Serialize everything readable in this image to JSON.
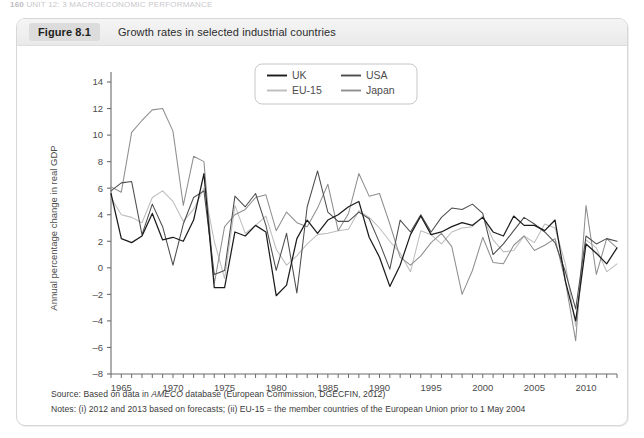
{
  "running_head": {
    "page_number": "160",
    "text": "UNIT 12: 3  MACROECONOMIC PERFORMANCE"
  },
  "figure": {
    "label": "Figure 8.1",
    "title": "Growth rates in selected industrial countries"
  },
  "footer": {
    "source_prefix": "Source: Based on data in ",
    "source_italic": "AMECO",
    "source_suffix": " database (European Commission, DGECFIN, 2012)",
    "notes": "Notes: (i) 2012 and 2013 based on forecasts; (ii) EU-15 = the member countries of the European Union prior to 1 May 2004"
  },
  "colors": {
    "uk": "#1b1b1b",
    "usa": "#4d4d4d",
    "eu15": "#bdbdbd",
    "japan": "#8f8f8f",
    "axis": "#6b6b6b",
    "panel_border": "#d7d7d9",
    "caption_bg": "#efeff0",
    "fig_label_bg": "#dcdcdc"
  },
  "legend": {
    "position": "top-center",
    "entries": [
      {
        "name": "UK",
        "color": "#1b1b1b"
      },
      {
        "name": "USA",
        "color": "#4d4d4d"
      },
      {
        "name": "EU-15",
        "color": "#bdbdbd"
      },
      {
        "name": "Japan",
        "color": "#8f8f8f"
      }
    ]
  },
  "chart_data": {
    "type": "line",
    "title": "Growth rates in selected industrial countries",
    "xlabel": "",
    "ylabel": "Annual percentage change in real GDP",
    "xlim": [
      1964,
      2013
    ],
    "ylim": [
      -8,
      14
    ],
    "ytick_step": 2,
    "yticks": [
      -8,
      -6,
      -4,
      -2,
      0,
      2,
      4,
      6,
      8,
      10,
      12,
      14
    ],
    "xticks_labeled": [
      1965,
      1970,
      1975,
      1980,
      1985,
      1990,
      1995,
      2000,
      2005,
      2010
    ],
    "xtick_step": 1,
    "grid": false,
    "x": [
      1964,
      1965,
      1966,
      1967,
      1968,
      1969,
      1970,
      1971,
      1972,
      1973,
      1974,
      1975,
      1976,
      1977,
      1978,
      1979,
      1980,
      1981,
      1982,
      1983,
      1984,
      1985,
      1986,
      1987,
      1988,
      1989,
      1990,
      1991,
      1992,
      1993,
      1994,
      1995,
      1996,
      1997,
      1998,
      1999,
      2000,
      2001,
      2002,
      2003,
      2004,
      2005,
      2006,
      2007,
      2008,
      2009,
      2010,
      2011,
      2012,
      2013
    ],
    "series": [
      {
        "name": "UK",
        "color": "#1b1b1b",
        "values": [
          5.6,
          2.2,
          1.9,
          2.4,
          4.1,
          2.1,
          2.3,
          2.0,
          3.6,
          7.1,
          -1.5,
          -1.5,
          2.7,
          2.4,
          3.2,
          2.7,
          -2.1,
          -1.3,
          2.2,
          3.6,
          2.6,
          3.6,
          4.0,
          4.6,
          5.0,
          2.3,
          0.8,
          -1.4,
          0.2,
          2.5,
          3.9,
          2.5,
          2.7,
          3.1,
          3.4,
          3.2,
          3.8,
          2.7,
          2.4,
          3.9,
          3.2,
          3.2,
          2.8,
          3.6,
          -1.0,
          -4.0,
          1.8,
          1.1,
          0.3,
          1.5
        ]
      },
      {
        "name": "USA",
        "color": "#4d4d4d",
        "values": [
          5.8,
          6.4,
          6.5,
          2.5,
          4.8,
          3.1,
          0.2,
          3.3,
          5.3,
          5.8,
          -0.5,
          -0.2,
          5.4,
          4.6,
          5.6,
          3.2,
          -0.2,
          2.6,
          -1.9,
          4.6,
          7.3,
          4.2,
          3.5,
          3.5,
          4.2,
          3.7,
          1.9,
          -0.1,
          3.6,
          2.7,
          4.0,
          2.7,
          3.8,
          4.5,
          4.4,
          4.8,
          4.1,
          1.0,
          1.8,
          2.8,
          3.8,
          3.3,
          2.7,
          1.9,
          -0.3,
          -3.1,
          2.4,
          1.8,
          2.2,
          2.0
        ]
      },
      {
        "name": "EU-15",
        "color": "#bdbdbd",
        "values": [
          5.3,
          4.0,
          3.8,
          3.4,
          5.3,
          5.8,
          5.0,
          3.5,
          4.4,
          6.0,
          2.0,
          -0.8,
          4.7,
          2.6,
          3.2,
          3.9,
          1.4,
          0.2,
          0.9,
          1.8,
          2.5,
          2.6,
          2.8,
          2.9,
          4.3,
          3.8,
          3.0,
          2.0,
          1.1,
          -0.3,
          2.8,
          2.5,
          1.8,
          2.7,
          3.0,
          3.1,
          3.9,
          2.1,
          1.2,
          1.3,
          2.4,
          1.9,
          3.3,
          3.0,
          0.3,
          -4.4,
          2.1,
          1.5,
          -0.3,
          0.3
        ]
      },
      {
        "name": "Japan",
        "color": "#8f8f8f",
        "values": [
          6.1,
          5.7,
          10.2,
          11.1,
          11.9,
          12.0,
          10.3,
          4.7,
          8.4,
          8.0,
          -1.2,
          3.1,
          4.0,
          4.4,
          5.3,
          5.5,
          2.8,
          4.2,
          3.4,
          3.1,
          4.5,
          6.3,
          2.8,
          4.1,
          7.1,
          5.4,
          5.6,
          3.3,
          0.8,
          0.2,
          0.9,
          1.9,
          2.6,
          1.6,
          -2.0,
          -0.2,
          2.3,
          0.4,
          0.3,
          1.7,
          2.4,
          1.3,
          1.7,
          2.2,
          -1.0,
          -5.5,
          4.7,
          -0.5,
          2.2,
          1.5
        ]
      }
    ]
  }
}
